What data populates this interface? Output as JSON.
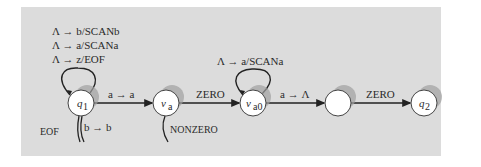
{
  "diagram": {
    "type": "state-machine",
    "background_color": "#dcdcdc",
    "states": [
      {
        "id": "q1",
        "label": "q",
        "sub": "1",
        "cx": 81,
        "cy": 103
      },
      {
        "id": "va",
        "label": "ν",
        "sub": "a",
        "cx": 166,
        "cy": 103
      },
      {
        "id": "va0",
        "label": "ν",
        "sub": "a0",
        "cx": 253,
        "cy": 103
      },
      {
        "id": "blank",
        "label": "",
        "sub": "",
        "cx": 338,
        "cy": 103
      },
      {
        "id": "q2",
        "label": "q",
        "sub": "2",
        "cx": 424,
        "cy": 103
      }
    ],
    "self_loop_labels": {
      "q1": [
        "Λ → b/SCANb",
        "Λ → a/SCANa",
        "Λ → z/EOF"
      ],
      "va0": [
        "Λ → a/SCANa"
      ]
    },
    "transitions": [
      {
        "from": "q1",
        "to": "va",
        "label": "a → a"
      },
      {
        "from": "va",
        "to": "va0",
        "label": "ZERO"
      },
      {
        "from": "va0",
        "to": "blank",
        "label": "a → Λ"
      },
      {
        "from": "blank",
        "to": "q2",
        "label": "ZERO"
      }
    ],
    "exit_labels": {
      "q1_eof": "EOF",
      "q1_b": "b → b",
      "va_nonzero": "NONZERO"
    }
  }
}
